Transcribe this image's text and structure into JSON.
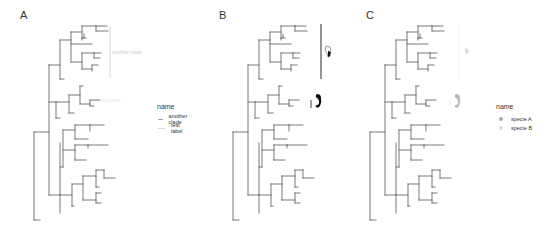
{
  "panels": [
    {
      "label": "A",
      "legend": {
        "title": "name",
        "key_type": "line",
        "items": [
          {
            "label": "another clade",
            "color": "#a0a0a0"
          },
          {
            "label": "test label",
            "color": "#d8d8d8"
          }
        ]
      },
      "annotations": [
        {
          "type": "clade-bar",
          "text": "another clade",
          "color": "#cfcfcf"
        },
        {
          "type": "text",
          "text": "test label",
          "color": "#e6e6e6"
        }
      ]
    },
    {
      "label": "B",
      "annotations": [
        {
          "type": "clade-bar-image",
          "image": "bird-silhouette",
          "color": "#111111"
        },
        {
          "type": "tip-image",
          "image": "seahorse-silhouette",
          "color": "#111111"
        }
      ]
    },
    {
      "label": "C",
      "legend": {
        "title": "name",
        "key_type": "point",
        "items": [
          {
            "label": "specie A",
            "color": "#a8a8a8"
          },
          {
            "label": "specie B",
            "color": "#dcdcdc"
          }
        ]
      },
      "annotations": [
        {
          "type": "clade-bar-image",
          "image": "bird-silhouette",
          "color": "#d8d8d8"
        },
        {
          "type": "tip-image",
          "image": "seahorse-silhouette",
          "color": "#b0b0b0"
        }
      ]
    }
  ],
  "chart_data": {
    "type": "tree",
    "title": "",
    "tree_color": "#555555",
    "segments": [
      [
        34,
        132,
        34,
        220
      ],
      [
        34,
        220,
        40,
        220
      ],
      [
        34,
        132,
        49,
        132
      ],
      [
        49,
        65,
        49,
        195
      ],
      [
        49,
        65,
        60,
        65
      ],
      [
        60,
        40,
        60,
        79
      ],
      [
        60,
        79,
        64,
        79
      ],
      [
        60,
        40,
        71,
        40
      ],
      [
        71,
        32,
        71,
        62
      ],
      [
        71,
        32,
        82,
        32
      ],
      [
        82,
        26,
        82,
        38
      ],
      [
        82,
        26,
        96,
        26
      ],
      [
        96,
        26,
        96,
        31
      ],
      [
        96,
        26,
        107,
        26
      ],
      [
        96,
        31,
        108,
        31
      ],
      [
        82,
        38,
        86,
        38
      ],
      [
        82,
        38,
        82,
        40
      ],
      [
        84,
        34,
        84,
        38
      ],
      [
        71,
        44,
        92,
        44
      ],
      [
        71,
        62,
        82,
        62
      ],
      [
        82,
        53,
        82,
        69
      ],
      [
        82,
        53,
        94,
        53
      ],
      [
        94,
        53,
        94,
        58
      ],
      [
        94,
        53,
        101,
        53
      ],
      [
        94,
        58,
        100,
        58
      ],
      [
        82,
        69,
        92,
        69
      ],
      [
        92,
        65,
        92,
        71
      ],
      [
        92,
        65,
        98,
        65
      ],
      [
        49,
        102,
        56,
        102
      ],
      [
        56,
        102,
        56,
        118
      ],
      [
        56,
        118,
        60,
        118
      ],
      [
        56,
        102,
        69,
        102
      ],
      [
        69,
        95,
        69,
        113
      ],
      [
        69,
        113,
        74,
        113
      ],
      [
        69,
        95,
        80,
        95
      ],
      [
        80,
        86,
        80,
        104
      ],
      [
        80,
        86,
        83,
        86
      ],
      [
        80,
        104,
        90,
        104
      ],
      [
        90,
        100,
        90,
        106
      ],
      [
        90,
        100,
        100,
        100
      ],
      [
        90,
        106,
        94,
        106
      ],
      [
        49,
        195,
        60,
        195
      ],
      [
        60,
        143,
        60,
        213
      ],
      [
        60,
        167,
        63,
        167
      ],
      [
        63,
        130,
        63,
        167
      ],
      [
        63,
        130,
        75,
        130
      ],
      [
        75,
        125,
        75,
        139
      ],
      [
        75,
        125,
        90,
        125
      ],
      [
        90,
        125,
        90,
        131
      ],
      [
        90,
        125,
        104,
        125
      ],
      [
        75,
        139,
        88,
        139
      ],
      [
        63,
        150,
        75,
        150
      ],
      [
        75,
        145,
        75,
        160
      ],
      [
        75,
        145,
        88,
        145
      ],
      [
        88,
        145,
        88,
        148
      ],
      [
        88,
        145,
        108,
        145
      ],
      [
        75,
        160,
        86,
        160
      ],
      [
        60,
        195,
        72,
        195
      ],
      [
        72,
        184,
        72,
        206
      ],
      [
        72,
        206,
        74,
        206
      ],
      [
        72,
        184,
        83,
        184
      ],
      [
        83,
        176,
        83,
        200
      ],
      [
        83,
        176,
        96,
        176
      ],
      [
        96,
        170,
        96,
        187
      ],
      [
        96,
        170,
        104,
        170
      ],
      [
        104,
        170,
        104,
        178
      ],
      [
        104,
        178,
        115,
        178
      ],
      [
        96,
        187,
        99,
        187
      ],
      [
        83,
        200,
        96,
        200
      ],
      [
        96,
        193,
        96,
        203
      ],
      [
        96,
        193,
        101,
        193
      ],
      [
        96,
        203,
        101,
        203
      ]
    ],
    "annotations": {
      "A": {
        "clade_bar": [
          110,
          26,
          110,
          78
        ],
        "clade_label": "another clade",
        "tip_label": "test label"
      },
      "B": {
        "clade_bar": [
          137,
          24,
          137,
          79
        ],
        "small_bar": [
          127,
          100,
          127,
          108
        ]
      },
      "C": {
        "clade_bar": [
          90,
          24,
          90,
          79
        ]
      }
    },
    "legend_A": {
      "title": "name",
      "entries": [
        "another clade",
        "test label"
      ]
    },
    "legend_C": {
      "title": "name",
      "entries": [
        "specie A",
        "specie B"
      ]
    }
  }
}
